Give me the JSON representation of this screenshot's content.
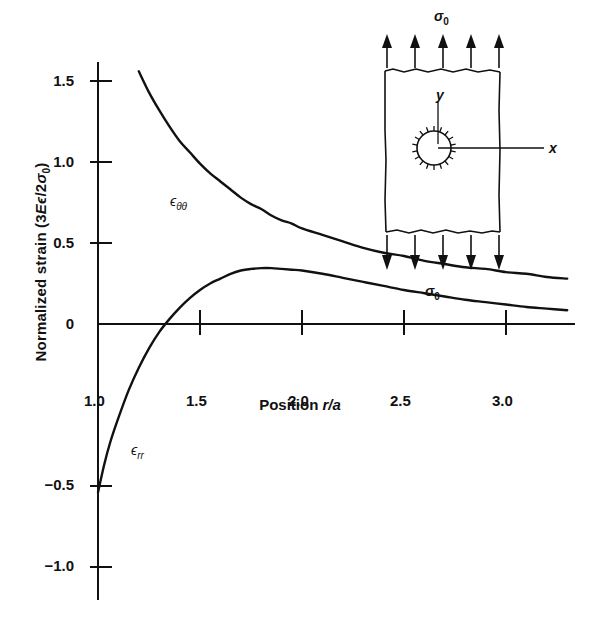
{
  "chart_data": {
    "type": "line",
    "title": "",
    "xlabel": "Position r/a",
    "xlabel_parts": {
      "prefix": "Position ",
      "italic": "r/a"
    },
    "ylabel": "Normalized strain (3Eε/2σ₀)",
    "ylabel_parts": {
      "prefix": "Normalized strain (3",
      "italic1": "E",
      "eps": "ϵ",
      "mid": "/2",
      "italic2": "σ",
      "sub": "0",
      "suffix": ")"
    },
    "xlim": [
      0.92,
      3.42
    ],
    "ylim": [
      -1.12,
      1.68
    ],
    "xticks": [
      1.0,
      1.5,
      2.0,
      2.5,
      3.0
    ],
    "xtick_labels": [
      "1.0",
      "1.5",
      "2.0",
      "2.5",
      "3.0"
    ],
    "yticks": [
      -1.0,
      -0.5,
      0,
      0.5,
      1.0,
      1.5
    ],
    "ytick_labels": [
      "−1.0",
      "−0.5",
      "0",
      "0.5",
      "1.0",
      "1.5"
    ],
    "grid": false,
    "legend": "inline-annotations",
    "legend_position": "on-curve",
    "series": [
      {
        "name": "ϵ_θθ",
        "label": "ϵ",
        "label_sub": "θθ",
        "label_x": 1.42,
        "label_y": 1.02,
        "color": "#111111",
        "x": [
          1.0,
          1.05,
          1.1,
          1.15,
          1.2,
          1.25,
          1.3,
          1.35,
          1.4,
          1.45,
          1.5,
          1.55,
          1.6,
          1.65,
          1.7,
          1.75,
          1.8,
          1.85,
          1.9,
          1.95,
          2.0,
          2.1,
          2.2,
          2.3,
          2.4,
          2.5,
          2.6,
          2.7,
          2.8,
          2.9,
          3.0,
          3.1,
          3.2,
          3.3,
          3.4
        ],
        "y": [
          2.33,
          2.09,
          1.88,
          1.71,
          1.56,
          1.43,
          1.32,
          1.22,
          1.13,
          1.06,
          0.99,
          0.93,
          0.88,
          0.83,
          0.78,
          0.74,
          0.71,
          0.67,
          0.64,
          0.62,
          0.59,
          0.55,
          0.51,
          0.47,
          0.44,
          0.42,
          0.39,
          0.37,
          0.35,
          0.34,
          0.32,
          0.31,
          0.29,
          0.28,
          0.27
        ]
      },
      {
        "name": "ϵ_rr",
        "label": "ϵ",
        "label_sub": "rr",
        "label_x": 1.18,
        "label_y": -0.33,
        "color": "#111111",
        "x": [
          1.0,
          1.03,
          1.06,
          1.1,
          1.15,
          1.2,
          1.25,
          1.3,
          1.35,
          1.4,
          1.45,
          1.5,
          1.55,
          1.6,
          1.65,
          1.7,
          1.75,
          1.8,
          1.85,
          1.9,
          1.95,
          2.0,
          2.1,
          2.2,
          2.3,
          2.4,
          2.5,
          2.6,
          2.7,
          2.8,
          2.9,
          3.0,
          3.1,
          3.2,
          3.3,
          3.4
        ],
        "y": [
          -1.04,
          -0.87,
          -0.73,
          -0.58,
          -0.41,
          -0.27,
          -0.15,
          -0.05,
          0.03,
          0.1,
          0.16,
          0.21,
          0.25,
          0.28,
          0.31,
          0.33,
          0.34,
          0.345,
          0.345,
          0.34,
          0.335,
          0.33,
          0.31,
          0.285,
          0.26,
          0.235,
          0.21,
          0.19,
          0.17,
          0.15,
          0.135,
          0.12,
          0.105,
          0.095,
          0.085,
          0.075
        ]
      }
    ],
    "crossing_point": {
      "x": 1.73,
      "y": 0.34
    }
  },
  "inset": {
    "name": "plate-with-hole-schematic",
    "top_stress_label": "σ",
    "top_stress_sub": "0",
    "bottom_stress_label": "σ",
    "bottom_stress_sub": "0",
    "y_axis_label": "y",
    "x_axis_label": "x",
    "arrow_count_top": 5,
    "arrow_count_bottom": 5,
    "hole": "circular-hole-with-hatching"
  },
  "colors": {
    "ink": "#111111",
    "background": "#ffffff"
  }
}
